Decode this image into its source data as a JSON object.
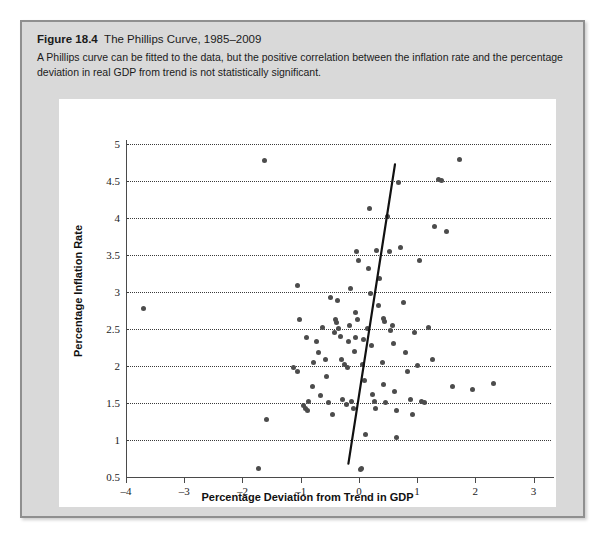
{
  "figure": {
    "number": "Figure 18.4",
    "name": "The Phillips Curve, 1985–2009",
    "description": "A Phillips curve can be fitted to the data, but the positive correlation between the inflation rate and the percentage deviation in real GDP from trend is not statistically significant."
  },
  "colors": {
    "panel_background": "#d9d9d9",
    "panel_border": "#8f8f8f",
    "chart_background": "#ffffff",
    "point": "#4c4c4c",
    "gridline": "#3a3a3a",
    "axis": "#4a4a4a",
    "fit_line": "#111111",
    "text": "#1b1b1b"
  },
  "chart_data": {
    "type": "scatter",
    "title": "The Phillips Curve, 1985–2009",
    "xlabel": "Percentage Deviation from Trend in GDP",
    "ylabel": "Percentage Inflation Rate",
    "xlim": [
      -4,
      3.3
    ],
    "ylim": [
      0.5,
      5.05
    ],
    "xticks": [
      -4,
      -3,
      -2,
      -1,
      0,
      1,
      2,
      3
    ],
    "xtick_labels": [
      "–4",
      "–3",
      "–2",
      "–1",
      "0",
      "1",
      "2",
      "3"
    ],
    "yticks": [
      0.5,
      1,
      1.5,
      2,
      2.5,
      3,
      3.5,
      4,
      4.5,
      5
    ],
    "ytick_labels": [
      "0.5",
      "1",
      "1.5",
      "2",
      "2.5",
      "3",
      "3.5",
      "4",
      "4.5",
      "5"
    ],
    "grid": "horizontal-dotted",
    "legend": null,
    "points": [
      [
        -3.7,
        2.77
      ],
      [
        -1.62,
        4.77
      ],
      [
        -1.58,
        1.28
      ],
      [
        -1.72,
        0.62
      ],
      [
        -1.05,
        3.08
      ],
      [
        -1.02,
        2.62
      ],
      [
        -0.9,
        2.38
      ],
      [
        -0.73,
        2.33
      ],
      [
        -1.12,
        1.98
      ],
      [
        -1.05,
        1.93
      ],
      [
        -0.95,
        1.47
      ],
      [
        -0.92,
        1.42
      ],
      [
        -0.88,
        1.4
      ],
      [
        -0.86,
        1.52
      ],
      [
        -0.8,
        1.72
      ],
      [
        -0.78,
        2.04
      ],
      [
        -0.7,
        2.18
      ],
      [
        -0.66,
        1.6
      ],
      [
        -0.62,
        2.52
      ],
      [
        -0.58,
        2.08
      ],
      [
        -0.55,
        1.86
      ],
      [
        -0.52,
        1.5
      ],
      [
        -0.48,
        2.93
      ],
      [
        -0.45,
        1.35
      ],
      [
        -0.42,
        2.45
      ],
      [
        -0.4,
        2.62
      ],
      [
        -0.38,
        2.58
      ],
      [
        -0.35,
        2.5
      ],
      [
        -0.32,
        2.4
      ],
      [
        -0.3,
        2.08
      ],
      [
        -0.28,
        1.55
      ],
      [
        -0.25,
        2.02
      ],
      [
        -0.22,
        1.48
      ],
      [
        -0.2,
        1.98
      ],
      [
        -0.18,
        2.33
      ],
      [
        -0.16,
        2.55
      ],
      [
        -0.14,
        3.05
      ],
      [
        -0.12,
        1.52
      ],
      [
        -0.1,
        1.42
      ],
      [
        -0.08,
        2.2
      ],
      [
        -0.06,
        2.72
      ],
      [
        -0.04,
        3.55
      ],
      [
        -0.02,
        2.62
      ],
      [
        0.0,
        3.42
      ],
      [
        0.02,
        0.6
      ],
      [
        0.05,
        0.62
      ],
      [
        0.07,
        2.02
      ],
      [
        0.1,
        1.8
      ],
      [
        0.12,
        1.07
      ],
      [
        0.14,
        2.5
      ],
      [
        0.16,
        3.32
      ],
      [
        0.18,
        4.12
      ],
      [
        0.2,
        2.98
      ],
      [
        0.22,
        2.27
      ],
      [
        0.24,
        1.62
      ],
      [
        0.26,
        1.52
      ],
      [
        0.3,
        3.56
      ],
      [
        0.33,
        2.82
      ],
      [
        0.36,
        3.18
      ],
      [
        0.4,
        2.05
      ],
      [
        0.43,
        1.75
      ],
      [
        0.46,
        1.5
      ],
      [
        0.5,
        4.02
      ],
      [
        0.52,
        3.55
      ],
      [
        0.55,
        2.48
      ],
      [
        0.58,
        2.55
      ],
      [
        0.6,
        2.3
      ],
      [
        0.62,
        1.66
      ],
      [
        0.65,
        1.4
      ],
      [
        0.68,
        4.48
      ],
      [
        0.72,
        3.6
      ],
      [
        0.76,
        2.85
      ],
      [
        0.8,
        2.18
      ],
      [
        0.84,
        1.92
      ],
      [
        0.88,
        1.55
      ],
      [
        0.92,
        1.35
      ],
      [
        0.96,
        2.45
      ],
      [
        1.0,
        2.0
      ],
      [
        1.04,
        3.42
      ],
      [
        1.08,
        1.52
      ],
      [
        1.12,
        1.5
      ],
      [
        1.2,
        2.52
      ],
      [
        1.26,
        2.08
      ],
      [
        1.3,
        3.88
      ],
      [
        1.36,
        4.52
      ],
      [
        1.42,
        4.5
      ],
      [
        1.5,
        3.82
      ],
      [
        1.6,
        1.72
      ],
      [
        1.72,
        4.78
      ],
      [
        1.96,
        1.68
      ],
      [
        2.32,
        1.76
      ],
      [
        0.42,
        2.64
      ],
      [
        0.44,
        2.6
      ],
      [
        -0.36,
        2.88
      ],
      [
        0.64,
        1.03
      ],
      [
        -0.05,
        2.38
      ],
      [
        0.08,
        2.36
      ],
      [
        0.28,
        1.42
      ]
    ],
    "fit_line": {
      "label": "fitted Phillips curve",
      "x_start": -0.18,
      "y_start": 0.68,
      "x_end": 0.62,
      "y_end": 4.72
    }
  }
}
